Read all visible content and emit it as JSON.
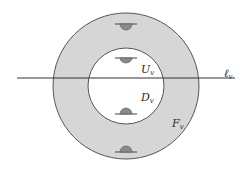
{
  "diagram": {
    "colors": {
      "background": "#ffffff",
      "annulus_fill": "#d6d6d6",
      "inner_fill": "#ffffff",
      "stroke": "#555555",
      "bump_fill": "#8a8a8a",
      "line": "#333333"
    },
    "outer_circle": {
      "cx": 126,
      "cy": 86,
      "r": 73
    },
    "inner_circle": {
      "cx": 126,
      "cy": 86,
      "r": 38
    },
    "line": {
      "x1": 17,
      "y1": 78,
      "x2": 235,
      "y2": 78
    },
    "bumps": [
      {
        "region": "annulus-top",
        "cx": 126,
        "y": 24,
        "direction": "down"
      },
      {
        "region": "inner-top",
        "cx": 126,
        "y": 58,
        "direction": "down"
      },
      {
        "region": "inner-bottom",
        "cx": 126,
        "y": 114,
        "direction": "up"
      },
      {
        "region": "annulus-bottom",
        "cx": 126,
        "y": 152,
        "direction": "up"
      }
    ],
    "labels": {
      "U": {
        "main": "U",
        "sub": "v"
      },
      "D": {
        "main": "D",
        "sub": "v"
      },
      "F": {
        "main": "F",
        "sub": "v"
      },
      "ell": {
        "main": "ℓ",
        "sub": "v"
      }
    }
  }
}
